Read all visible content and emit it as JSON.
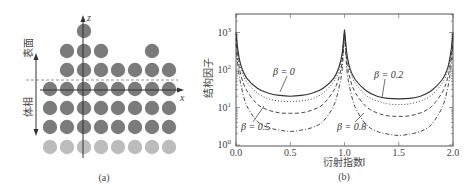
{
  "panel_a": {
    "caption": "(a)",
    "surface_label": "表面",
    "bulk_label": "体相",
    "z_axis_label": "z",
    "x_axis_label": "x",
    "colors": {
      "atom_dark": "#7b7b7b",
      "atom_light": "#bcbcbc",
      "axis": "#333333",
      "dashed": "#888888"
    },
    "atom_columns_x": [
      50,
      67,
      84,
      101,
      118,
      135,
      152,
      169
    ],
    "rows": [
      {
        "y": 31,
        "columns": [
          2
        ],
        "shade": "dark"
      },
      {
        "y": 51,
        "columns": [
          1,
          2,
          3,
          6
        ],
        "shade": "dark"
      },
      {
        "y": 70,
        "columns": [
          0,
          1,
          2,
          3,
          4,
          5,
          6,
          7
        ],
        "shade": "dark",
        "start": 1
      },
      {
        "y": 89,
        "columns": [
          0,
          1,
          2,
          3,
          4,
          5,
          6,
          7
        ],
        "shade": "dark"
      },
      {
        "y": 108,
        "columns": [
          0,
          1,
          2,
          3,
          4,
          5,
          6,
          7
        ],
        "shade": "dark"
      },
      {
        "y": 127,
        "columns": [
          0,
          1,
          2,
          3,
          4,
          5,
          6,
          7
        ],
        "shade": "dark"
      },
      {
        "y": 147,
        "columns": [
          0,
          1,
          2,
          3,
          4,
          5,
          6,
          7
        ],
        "shade": "light"
      }
    ]
  },
  "panel_b": {
    "caption": "(b)"
  },
  "chart_data": {
    "type": "line",
    "title": "",
    "xlabel": "衍射指数l",
    "ylabel": "结构因子",
    "xlim": [
      0.0,
      2.0
    ],
    "ylim": [
      1,
      3000
    ],
    "yscale": "log",
    "grid": false,
    "x_ticks": [
      "0.0",
      "0.5",
      "1.0",
      "1.5",
      "2.0"
    ],
    "y_ticks": [
      "10^0",
      "10^1",
      "10^2",
      "10^3"
    ],
    "x": [
      0.0,
      0.02,
      0.05,
      0.1,
      0.2,
      0.3,
      0.4,
      0.5,
      0.6,
      0.7,
      0.8,
      0.9,
      0.95,
      0.98,
      1.0,
      1.02,
      1.05,
      1.1,
      1.2,
      1.3,
      1.4,
      1.5,
      1.6,
      1.7,
      1.8,
      1.9,
      1.95,
      1.98,
      2.0
    ],
    "series": [
      {
        "name": "β = 0",
        "style": "solid",
        "values": [
          1000,
          300,
          120,
          60,
          32,
          24,
          21,
          20,
          21,
          24,
          32,
          60,
          120,
          300,
          1200,
          300,
          110,
          55,
          28,
          20,
          17.5,
          17,
          17.5,
          20,
          28,
          55,
          110,
          300,
          1000
        ]
      },
      {
        "name": "β = 0.2",
        "style": "dotted",
        "values": [
          900,
          260,
          100,
          48,
          24,
          17,
          15,
          14.5,
          15,
          17,
          24,
          48,
          100,
          260,
          1100,
          260,
          95,
          44,
          21,
          15,
          12.5,
          12,
          12.5,
          15,
          21,
          44,
          95,
          260,
          900
        ]
      },
      {
        "name": "β = 0.5",
        "style": "dashed",
        "values": [
          700,
          180,
          65,
          28,
          12,
          8.5,
          7.2,
          7,
          7.2,
          8.5,
          12,
          28,
          65,
          180,
          1000,
          180,
          60,
          25,
          10.5,
          7.2,
          6,
          5.8,
          6,
          7.2,
          10.5,
          25,
          60,
          180,
          700
        ]
      },
      {
        "name": "β = 0.8",
        "style": "dashdot",
        "values": [
          500,
          110,
          35,
          11,
          4.2,
          2.9,
          2.5,
          2.3,
          2.5,
          2.9,
          4.2,
          11,
          35,
          110,
          900,
          110,
          32,
          10,
          3.5,
          2.3,
          1.95,
          1.8,
          1.95,
          2.3,
          3.5,
          10,
          32,
          110,
          500
        ]
      }
    ],
    "annotations": [
      {
        "text": "β = 0",
        "x": 0.55,
        "y": 45
      },
      {
        "text": "β = 0.2",
        "x": 1.55,
        "y": 40
      },
      {
        "text": "β = 0.5",
        "x": 0.1,
        "y": 2.3
      },
      {
        "text": "β = 0.8",
        "x": 1.05,
        "y": 2.3
      }
    ],
    "legend": "none (inline annotations)"
  }
}
